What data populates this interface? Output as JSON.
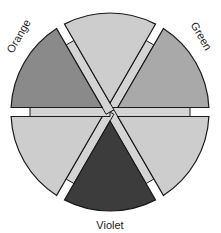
{
  "diagram": {
    "center": [
      110,
      112
    ],
    "outer_radius": 99,
    "band_radius": 80,
    "band_half_width": 4.5,
    "stroke": "#1a1a1a",
    "wedges": [
      {
        "id": "top",
        "angle": 0,
        "fill": "#cdcdcd",
        "label": ""
      },
      {
        "id": "upper-right",
        "angle": 60,
        "fill": "#a9a9a9",
        "label": "Green"
      },
      {
        "id": "lower-right",
        "angle": 120,
        "fill": "#cdcdcd",
        "label": ""
      },
      {
        "id": "bottom",
        "angle": 180,
        "fill": "#3c3c3c",
        "label": "Violet"
      },
      {
        "id": "lower-left",
        "angle": 240,
        "fill": "#cdcdcd",
        "label": ""
      },
      {
        "id": "upper-left",
        "angle": 300,
        "fill": "#8a8a8a",
        "label": "Orange"
      }
    ],
    "bands": [
      {
        "angle": 30,
        "fill": "#d4d4d4"
      },
      {
        "angle": 90,
        "fill": "#d4d4d4"
      },
      {
        "angle": 150,
        "fill": "#d4d4d4"
      },
      {
        "angle": 210,
        "fill": "#d4d4d4"
      },
      {
        "angle": 270,
        "fill": "#d4d4d4"
      },
      {
        "angle": 330,
        "fill": "#d4d4d4"
      }
    ],
    "labels": {
      "green": {
        "text": "Green",
        "x": 198,
        "y": 38,
        "rotate": 60
      },
      "orange": {
        "text": "Orange",
        "x": 22,
        "y": 38,
        "rotate": -60
      },
      "violet": {
        "text": "Violet",
        "x": 110,
        "y": 229,
        "rotate": 0
      }
    }
  }
}
